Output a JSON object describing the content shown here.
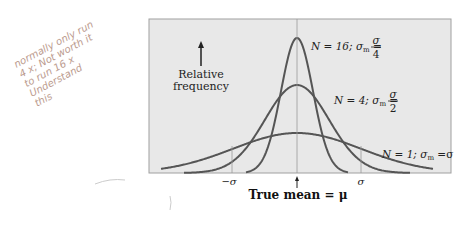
{
  "figure": {
    "ylabel_line1": "Relative",
    "ylabel_line2": "frequency",
    "xlabel": "True mean = μ",
    "tick_minus_sigma": "−σ",
    "tick_sigma": "σ",
    "curves": [
      {
        "label": "N = 16; σ",
        "sub": "m",
        "eq": " = ",
        "num": "σ",
        "den": "4"
      },
      {
        "label": "N = 4; σ",
        "sub": "m",
        "eq": " = ",
        "num": "σ",
        "den": "2"
      },
      {
        "label": "N = 1; σ",
        "sub": "m",
        "eq": " =σ"
      }
    ]
  },
  "handwritten_note": {
    "lines": [
      "normally only run",
      "4 x; Not worth it",
      "to run 16 x",
      "Understand",
      "this"
    ]
  },
  "chart_data": {
    "type": "line",
    "title": "",
    "xlabel": "True mean = μ",
    "ylabel": "Relative frequency",
    "x_ticks": [
      "−σ",
      "μ",
      "σ"
    ],
    "series": [
      {
        "name": "N = 1; σm = σ",
        "sigma_m": "σ",
        "relative_peak": 1
      },
      {
        "name": "N = 4; σm = σ/2",
        "sigma_m": "σ/2",
        "relative_peak": 2
      },
      {
        "name": "N = 16; σm = σ/4",
        "sigma_m": "σ/4",
        "relative_peak": 4
      }
    ],
    "grid": false,
    "legend": "inline labels"
  },
  "colors": {
    "panel": "#e8e8e8",
    "curve": "#555555",
    "border": "#9a9a9a"
  }
}
